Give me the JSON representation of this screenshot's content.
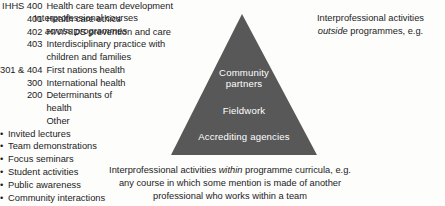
{
  "figure": {
    "background_color": "#fdfdfc",
    "text_color": "#1c1c1c"
  },
  "pyramid": {
    "fill_color": "#585858",
    "label_color": "#ffffff",
    "tiers": [
      {
        "name": "community-partners",
        "line1": "Community",
        "line2": "partners"
      },
      {
        "name": "fieldwork",
        "line1": "Fieldwork"
      },
      {
        "name": "accrediting-agencies",
        "line1": "Accrediting agencies"
      }
    ]
  },
  "left_panel": {
    "heading_line1": "Interprofessional courses",
    "heading_line2_italic": "across programmes",
    "courses": [
      {
        "code": "IHHS 400",
        "name": "Health care team development"
      },
      {
        "code": "401",
        "name": "Health care ethics"
      },
      {
        "code": "402",
        "name": "HIV/AIDS prevention and care"
      },
      {
        "code": "403",
        "name": "Interdisciplinary practice with"
      },
      {
        "code": "",
        "name": "children and families"
      },
      {
        "code": "301 & 404",
        "name": "First nations health"
      },
      {
        "code": "300",
        "name": "International health"
      },
      {
        "code": "200",
        "name": "Determinants of"
      },
      {
        "code": "",
        "name": "health"
      },
      {
        "code": "",
        "name": "Other"
      }
    ]
  },
  "right_panel": {
    "heading_line1": "Interprofessional activities",
    "heading_line2_italic": "outside",
    "heading_line2_rest": " programmes, e.g.",
    "bullet_char": "•",
    "bullets": [
      "Invited lectures",
      "Team demonstrations",
      "Focus seminars",
      "Student activities",
      "Public awareness",
      "Community interactions",
      "Other"
    ]
  },
  "bottom_caption": {
    "line1_pre": "Interprofessional activities ",
    "line1_italic": "within",
    "line1_post": " programme curricula, e.g.",
    "line2": "any course in which some mention is made of another",
    "line3": "professional who works within a team"
  }
}
